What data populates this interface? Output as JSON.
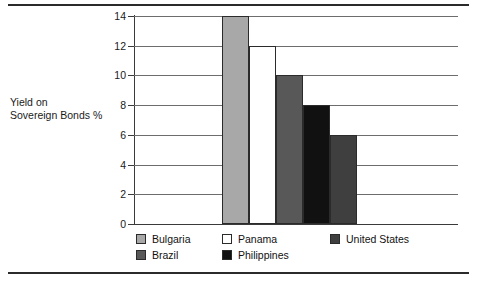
{
  "chart_data": {
    "type": "bar",
    "title": "",
    "xlabel": "",
    "ylabel": "Yield on Sovereign Bonds %",
    "ylim": [
      0,
      14
    ],
    "ytick_step": 2,
    "yticks": [
      "14",
      "12",
      "10",
      "8",
      "6",
      "4",
      "2",
      "0"
    ],
    "grid": true,
    "legend_position": "bottom",
    "categories": [
      "Bulgaria",
      "Panama",
      "Brazil",
      "Philippines",
      "United States"
    ],
    "values": [
      14,
      12,
      10,
      8,
      6
    ],
    "series": [
      {
        "name": "Yield on Sovereign Bonds %",
        "values": [
          14,
          12,
          10,
          8,
          6
        ]
      }
    ],
    "bars": [
      {
        "label": "Bulgaria",
        "value": 14,
        "color": "#a8a8a8"
      },
      {
        "label": "Panama",
        "value": 12,
        "color": "#ffffff"
      },
      {
        "label": "Brazil",
        "value": 10,
        "color": "#585858"
      },
      {
        "label": "Philippines",
        "value": 8,
        "color": "#111111"
      },
      {
        "label": "United States",
        "value": 6,
        "color": "#3f3f3f"
      }
    ]
  },
  "axis": {
    "y_label_line1": "Yield on",
    "y_label_line2": "Sovereign Bonds %",
    "ticks": [
      {
        "label": "14",
        "value": 14
      },
      {
        "label": "12",
        "value": 12
      },
      {
        "label": "10",
        "value": 10
      },
      {
        "label": "8",
        "value": 8
      },
      {
        "label": "6",
        "value": 6
      },
      {
        "label": "4",
        "value": 4
      },
      {
        "label": "2",
        "value": 2
      },
      {
        "label": "0",
        "value": 0
      }
    ]
  },
  "legend": {
    "rows": [
      [
        {
          "label": "Bulgaria",
          "color": "#a8a8a8"
        },
        {
          "label": "Panama",
          "color": "#ffffff"
        },
        {
          "label": "United States",
          "color": "#3f3f3f"
        }
      ],
      [
        {
          "label": "Brazil",
          "color": "#585858"
        },
        {
          "label": "Philippines",
          "color": "#111111"
        }
      ]
    ]
  },
  "colors": {
    "rule": "#2b2b2b",
    "grid": "#6d6d6d",
    "axis": "#3a3a3a",
    "text": "#1a1a1a",
    "background": "#ffffff"
  }
}
